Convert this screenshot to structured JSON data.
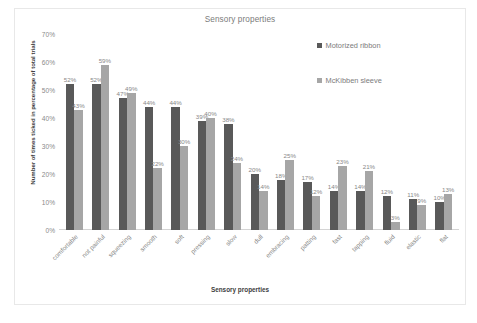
{
  "chart_data": {
    "type": "bar",
    "title": "Sensory properties",
    "xlabel": "Sensory properties",
    "ylabel": "Number of times ticked in percentage of total trials",
    "ylim": [
      0,
      70
    ],
    "ytick_labels": [
      "70%",
      "60%",
      "50%",
      "40%",
      "30%",
      "20%",
      "10%",
      "0%"
    ],
    "ytick_values": [
      70,
      60,
      50,
      40,
      30,
      20,
      10,
      0
    ],
    "grid": false,
    "legend_position": "top-right",
    "value_label_suffix": "%",
    "categories": [
      "comfortable",
      "not painful",
      "squeezing",
      "smooth",
      "soft",
      "pressing",
      "slow",
      "dull",
      "embracing",
      "patting",
      "fast",
      "tapping",
      "fluid",
      "elastic",
      "flat"
    ],
    "series": [
      {
        "name": "Motorized ribbon",
        "color": "#595959",
        "values": [
          52,
          52,
          47,
          44,
          44,
          39,
          38,
          20,
          18,
          17,
          14,
          14,
          12,
          11,
          10
        ],
        "labels": [
          "52%",
          "52%",
          "47%",
          "44%",
          "44%",
          "39%",
          "38%",
          "20%",
          "18%",
          "17%",
          "14%",
          "14%",
          "12%",
          "11%",
          "10%"
        ]
      },
      {
        "name": "McKibben sleeve",
        "color": "#a6a6a6",
        "values": [
          43,
          59,
          49,
          22,
          30,
          40,
          24,
          14,
          25,
          12,
          23,
          21,
          3,
          9,
          13
        ],
        "labels": [
          "43%",
          "59%",
          "49%",
          "22%",
          "30%",
          "40%",
          "24%",
          "14%",
          "25%",
          "12%",
          "23%",
          "21%",
          "3%",
          "9%",
          "13%"
        ]
      }
    ]
  }
}
